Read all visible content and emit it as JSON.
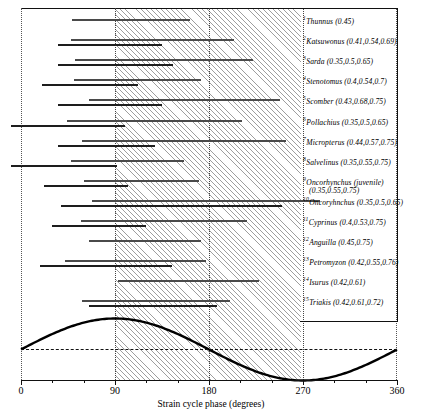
{
  "figure": {
    "axis_title": "Strain cycle phase (degrees)",
    "x_ticks": [
      {
        "label": "0",
        "deg": 0
      },
      {
        "label": "90",
        "deg": 90
      },
      {
        "label": "180",
        "deg": 180
      },
      {
        "label": "270",
        "deg": 270
      },
      {
        "label": "360",
        "deg": 360
      }
    ],
    "shaded_band": {
      "start_deg": 90,
      "end_deg": 270,
      "meaning": "shortening-phase band"
    },
    "colors": {
      "bar": "#4a4a4a",
      "bar_dark": "#1d1d1d",
      "axis": "#111111",
      "shade": "#7d7d7d"
    }
  },
  "chart_data": {
    "type": "bar",
    "title": "",
    "xlabel": "Strain cycle phase (degrees)",
    "ylabel": "",
    "xlim": [
      0,
      360
    ],
    "grid": true,
    "legend": "none",
    "categories": [
      "Thunnus",
      "Katsuwonus",
      "Sarda",
      "Stenotomus",
      "Scomber",
      "Pollachius",
      "Micropterus",
      "Salvelinus",
      "Oncorhynchus (juvenile)",
      "Oncoryhnchus",
      "Cyprinus",
      "Anguilla",
      "Petromyzon",
      "Isurus",
      "Triakis"
    ],
    "rows": [
      {
        "index": 1,
        "genus": "Thunnus",
        "phases": [
          0.45
        ],
        "label": "Thunnus (0.45)",
        "bars": [
          {
            "start_deg": 49,
            "end_deg": 162
          }
        ]
      },
      {
        "index": 2,
        "genus": "Katsuwonus",
        "phases": [
          0.41,
          0.54,
          0.69
        ],
        "label": "Katsuwonus (0.41,0.54,0.69)",
        "bars": [
          {
            "start_deg": 48,
            "end_deg": 204
          },
          {
            "start_deg": 35,
            "end_deg": 135
          }
        ]
      },
      {
        "index": 3,
        "genus": "Sarda",
        "phases": [
          0.35,
          0.5,
          0.65
        ],
        "label": "Sarda (0.35,0.5,0.65)",
        "bars": [
          {
            "start_deg": 52,
            "end_deg": 222
          },
          {
            "start_deg": 35,
            "end_deg": 146
          }
        ]
      },
      {
        "index": 4,
        "genus": "Stenotomus",
        "phases": [
          0.4,
          0.54,
          0.7
        ],
        "label": "Stenotomus (0.4,0.54,0.7)",
        "bars": [
          {
            "start_deg": 51,
            "end_deg": 172
          },
          {
            "start_deg": 20,
            "end_deg": 112
          }
        ]
      },
      {
        "index": 5,
        "genus": "Scomber",
        "phases": [
          0.43,
          0.68,
          0.75
        ],
        "label": "Scomber (0.43,0.68,0.75)",
        "bars": [
          {
            "start_deg": 65,
            "end_deg": 248
          },
          {
            "start_deg": 35,
            "end_deg": 135
          }
        ]
      },
      {
        "index": 6,
        "genus": "Pollachius",
        "phases": [
          0.35,
          0.5,
          0.65
        ],
        "label": "Pollachius (0.35,0.5,0.65)",
        "bars": [
          {
            "start_deg": 44,
            "end_deg": 212
          },
          {
            "start_deg": -10,
            "end_deg": 100
          }
        ]
      },
      {
        "index": 7,
        "genus": "Micropterus",
        "phases": [
          0.44,
          0.57,
          0.75
        ],
        "label": "Micropterus (0.44,0.57,0.75)",
        "bars": [
          {
            "start_deg": 58,
            "end_deg": 254
          },
          {
            "start_deg": 35,
            "end_deg": 128
          }
        ]
      },
      {
        "index": 8,
        "genus": "Salvelinus",
        "phases": [
          0.35,
          0.55,
          0.75
        ],
        "label": "Salvelinus (0.35,0.55,0.75)",
        "bars": [
          {
            "start_deg": 48,
            "end_deg": 156
          },
          {
            "start_deg": -10,
            "end_deg": 92
          }
        ]
      },
      {
        "index": 9,
        "genus": "Oncorhynchus (juvenile)",
        "phases": [
          0.35,
          0.55,
          0.75
        ],
        "label": "Oncorhynchus (juvenile)",
        "label2": "(0.35,0.55,0.75)",
        "bars": [
          {
            "start_deg": 60,
            "end_deg": 170
          },
          {
            "start_deg": 22,
            "end_deg": 102
          }
        ]
      },
      {
        "index": 10,
        "genus": "Oncoryhnchus",
        "phases": [
          0.35,
          0.5,
          0.65
        ],
        "label": "Oncoryhnchus (0.35,0.5,0.65)",
        "bars": [
          {
            "start_deg": 68,
            "end_deg": 286
          },
          {
            "start_deg": 38,
            "end_deg": 250
          }
        ]
      },
      {
        "index": 11,
        "genus": "Cyprinus",
        "phases": [
          0.4,
          0.53,
          0.75
        ],
        "label": "Cyprinus (0.4,0.53,0.75)",
        "bars": [
          {
            "start_deg": 57,
            "end_deg": 216
          },
          {
            "start_deg": 30,
            "end_deg": 120
          }
        ]
      },
      {
        "index": 12,
        "genus": "Anguilla",
        "phases": [
          0.45,
          0.75
        ],
        "label": "Anguilla (0.45,0.75)",
        "bars": [
          {
            "start_deg": 65,
            "end_deg": 172
          }
        ]
      },
      {
        "index": 13,
        "genus": "Petromyzon",
        "phases": [
          0.42,
          0.55,
          0.76
        ],
        "label": "Petromyzon (0.42,0.55,0.76)",
        "bars": [
          {
            "start_deg": 42,
            "end_deg": 177
          },
          {
            "start_deg": 18,
            "end_deg": 145
          }
        ]
      },
      {
        "index": 14,
        "genus": "Isurus",
        "phases": [
          0.42,
          0.61
        ],
        "label": "Isurus (0.42,0.61)",
        "bars": [
          {
            "start_deg": 93,
            "end_deg": 228
          }
        ]
      },
      {
        "index": 15,
        "genus": "Triakis",
        "phases": [
          0.42,
          0.61,
          0.72
        ],
        "label": "Triakis (0.42,0.61,0.72)",
        "bars": [
          {
            "start_deg": 58,
            "end_deg": 200
          },
          {
            "start_deg": 65,
            "end_deg": 188
          }
        ]
      }
    ],
    "strain_curve": {
      "description": "sinusoidal muscle strain cycle, peak at 90 degrees, trough at 270 degrees",
      "peak_deg": 90,
      "trough_deg": 270,
      "zero_line": true
    }
  }
}
